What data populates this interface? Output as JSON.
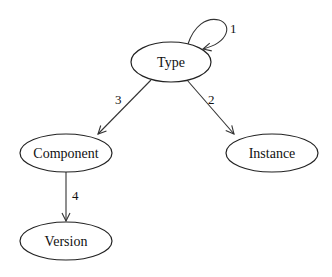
{
  "diagram": {
    "type": "directed-graph",
    "colors": {
      "stroke": "#222222",
      "background": "#ffffff",
      "text": "#111111"
    },
    "nodes": [
      {
        "id": "type",
        "label": "Type"
      },
      {
        "id": "component",
        "label": "Component"
      },
      {
        "id": "instance",
        "label": "Instance"
      },
      {
        "id": "version",
        "label": "Version"
      }
    ],
    "edges": [
      {
        "from": "type",
        "to": "type",
        "label": "1"
      },
      {
        "from": "type",
        "to": "instance",
        "label": "2"
      },
      {
        "from": "type",
        "to": "component",
        "label": "3"
      },
      {
        "from": "component",
        "to": "version",
        "label": "4"
      }
    ]
  }
}
